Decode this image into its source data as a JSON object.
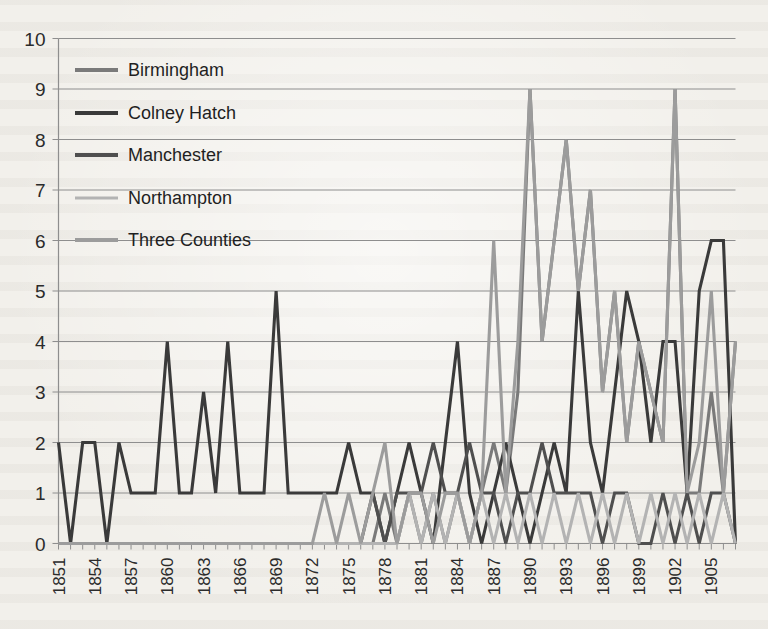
{
  "chart_data": {
    "type": "line",
    "title": "",
    "xlabel": "",
    "ylabel": "",
    "ylim": [
      0,
      10
    ],
    "ytick_step": 1,
    "yticks": [
      0,
      1,
      2,
      3,
      4,
      5,
      6,
      7,
      8,
      9,
      10
    ],
    "grid": true,
    "legend_position": "upper-left-inside",
    "xtick_labels": [
      "1851",
      "1854",
      "1857",
      "1860",
      "1863",
      "1866",
      "1869",
      "1872",
      "1875",
      "1878",
      "1881",
      "1884",
      "1887",
      "1890",
      "1893",
      "1896",
      "1899",
      "1902",
      "1905"
    ],
    "xtick_step": 3,
    "x": [
      1851,
      1852,
      1853,
      1854,
      1855,
      1856,
      1857,
      1858,
      1859,
      1860,
      1861,
      1862,
      1863,
      1864,
      1865,
      1866,
      1867,
      1868,
      1869,
      1870,
      1871,
      1872,
      1873,
      1874,
      1875,
      1876,
      1877,
      1878,
      1879,
      1880,
      1881,
      1882,
      1883,
      1884,
      1885,
      1886,
      1887,
      1888,
      1889,
      1890,
      1891,
      1892,
      1893,
      1894,
      1895,
      1896,
      1897,
      1898,
      1899,
      1900,
      1901,
      1902,
      1903,
      1904,
      1905,
      1906,
      1907
    ],
    "series": [
      {
        "name": "Birmingham",
        "color": "#7a7a7a",
        "values": [
          0,
          0,
          0,
          0,
          0,
          0,
          0,
          0,
          0,
          0,
          0,
          0,
          0,
          0,
          0,
          0,
          0,
          0,
          0,
          0,
          0,
          0,
          0,
          0,
          0,
          0,
          0,
          1,
          0,
          1,
          0,
          1,
          0,
          1,
          0,
          1,
          2,
          1,
          3,
          9,
          4,
          6,
          8,
          5,
          7,
          3,
          5,
          2,
          4,
          3,
          2,
          9,
          1,
          1,
          3,
          1,
          4
        ]
      },
      {
        "name": "Colney Hatch",
        "color": "#3a3a3a",
        "values": [
          2,
          0,
          2,
          2,
          0,
          2,
          1,
          1,
          1,
          4,
          1,
          1,
          3,
          1,
          4,
          1,
          1,
          1,
          5,
          1,
          1,
          1,
          1,
          1,
          2,
          1,
          1,
          0,
          1,
          2,
          1,
          0,
          2,
          4,
          1,
          0,
          1,
          2,
          1,
          0,
          1,
          2,
          1,
          5,
          2,
          1,
          3,
          5,
          4,
          2,
          4,
          4,
          1,
          5,
          6,
          6,
          0
        ]
      },
      {
        "name": "Manchester",
        "color": "#4f4f4f",
        "values": [
          0,
          0,
          0,
          0,
          0,
          0,
          0,
          0,
          0,
          0,
          0,
          0,
          0,
          0,
          0,
          0,
          0,
          0,
          0,
          0,
          0,
          0,
          0,
          0,
          0,
          0,
          1,
          0,
          1,
          1,
          1,
          2,
          1,
          1,
          2,
          1,
          1,
          0,
          1,
          1,
          2,
          1,
          1,
          1,
          1,
          0,
          1,
          1,
          0,
          0,
          1,
          0,
          1,
          0,
          1,
          1,
          0
        ]
      },
      {
        "name": "Northampton",
        "color": "#b3b3b3",
        "values": [
          0,
          0,
          0,
          0,
          0,
          0,
          0,
          0,
          0,
          0,
          0,
          0,
          0,
          0,
          0,
          0,
          0,
          0,
          0,
          0,
          0,
          0,
          0,
          0,
          0,
          0,
          0,
          0,
          0,
          1,
          0,
          1,
          0,
          1,
          0,
          1,
          0,
          1,
          0,
          1,
          0,
          1,
          0,
          1,
          0,
          1,
          0,
          1,
          0,
          1,
          0,
          1,
          0,
          1,
          0,
          1,
          0
        ]
      },
      {
        "name": "Three Counties",
        "color": "#9c9c9c",
        "values": [
          0,
          0,
          0,
          0,
          0,
          0,
          0,
          0,
          0,
          0,
          0,
          0,
          0,
          0,
          0,
          0,
          0,
          0,
          0,
          0,
          0,
          0,
          1,
          0,
          1,
          0,
          1,
          2,
          0,
          1,
          1,
          0,
          1,
          1,
          0,
          1,
          6,
          1,
          4,
          9,
          4,
          6,
          8,
          5,
          7,
          3,
          5,
          2,
          4,
          3,
          2,
          9,
          1,
          2,
          5,
          1,
          4
        ]
      }
    ]
  },
  "legend": {
    "items": [
      {
        "label": "Birmingham"
      },
      {
        "label": "Colney Hatch"
      },
      {
        "label": "Manchester"
      },
      {
        "label": "Northampton"
      },
      {
        "label": "Three Counties"
      }
    ]
  }
}
